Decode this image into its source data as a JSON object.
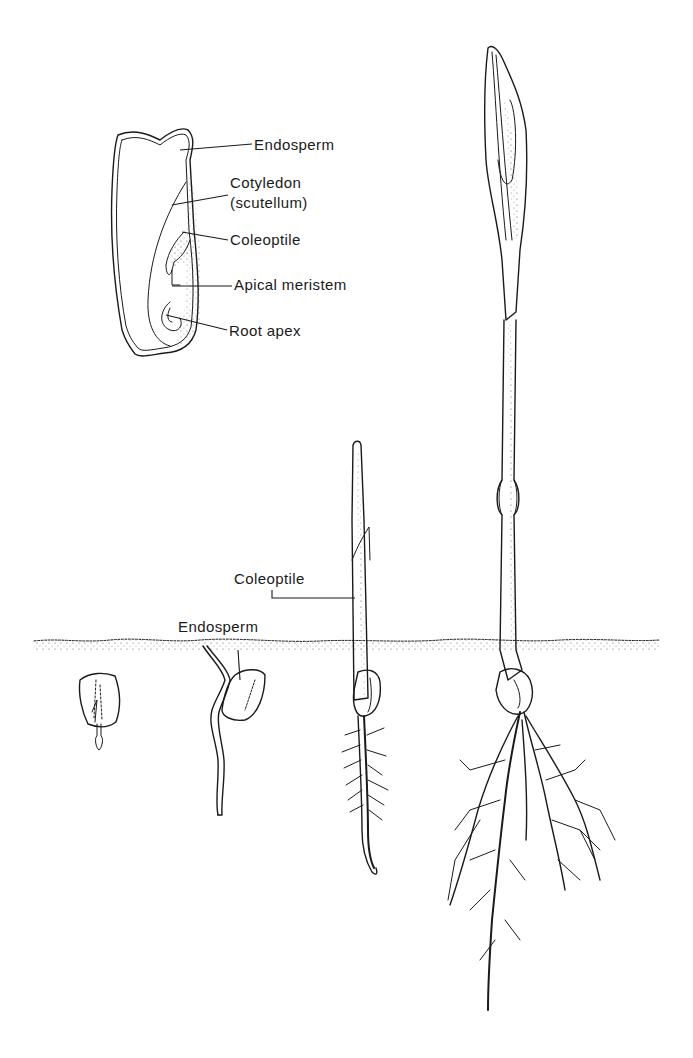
{
  "figure": {
    "colors": {
      "ink": "#1a1a1a",
      "background": "#ffffff",
      "soil_stipple": "#6b6b6b"
    }
  },
  "kernel_section": {
    "labels": [
      {
        "id": "endosperm",
        "text": "Endosperm"
      },
      {
        "id": "cotyledon",
        "text": "Cotyledon"
      },
      {
        "id": "scutellum",
        "text": "(scutellum)"
      },
      {
        "id": "coleoptile",
        "text": "Coleoptile"
      },
      {
        "id": "apical_meristem",
        "text": "Apical meristem"
      },
      {
        "id": "root_apex",
        "text": "Root apex"
      }
    ]
  },
  "seedling_stages": {
    "labels": [
      {
        "id": "endosperm",
        "text": "Endosperm"
      },
      {
        "id": "coleoptile",
        "text": "Coleoptile"
      }
    ],
    "stages": [
      {
        "id": "stage-1",
        "name": "kernel with emerging radicle"
      },
      {
        "id": "stage-2",
        "name": "germinating seed with primary root"
      },
      {
        "id": "stage-3",
        "name": "coleoptile emerged above soil"
      },
      {
        "id": "stage-4",
        "name": "seedling with first leaves and root system"
      }
    ]
  },
  "soil_line": {
    "label": "soil surface"
  }
}
